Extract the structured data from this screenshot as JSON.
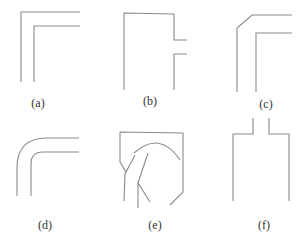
{
  "figure": {
    "line_color": "#8a8a8a",
    "label_color": "#333333",
    "panels": [
      {
        "id": "a",
        "label": "(a)",
        "shape": "sharp right-angle bend"
      },
      {
        "id": "b",
        "label": "(b)",
        "shape": "box with side branch stub"
      },
      {
        "id": "c",
        "label": "(c)",
        "shape": "chamfered outer-corner bend"
      },
      {
        "id": "d",
        "label": "(d)",
        "shape": "rounded bend"
      },
      {
        "id": "e",
        "label": "(e)",
        "shape": "chamfered enclosure with curved guide vane"
      },
      {
        "id": "f",
        "label": "(f)",
        "shape": "expansion from narrow neck to wide channel"
      }
    ]
  }
}
